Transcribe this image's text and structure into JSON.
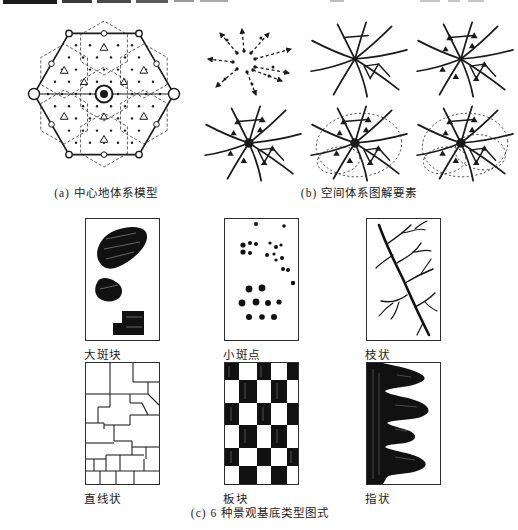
{
  "page": {
    "background": "#ffffff",
    "ink": "#1a1a1a",
    "panel_border": "#2e2e2e"
  },
  "figure_a": {
    "caption": "(a) 中心地体系模型"
  },
  "figure_b": {
    "caption": "(b) 空间体系图解要素"
  },
  "figure_c": {
    "caption": "(c) 6 种景观基底类型图式",
    "panels": [
      {
        "label": "大斑块"
      },
      {
        "label": "小斑点"
      },
      {
        "label": "枝状"
      },
      {
        "label": "直线状"
      },
      {
        "label": "板块"
      },
      {
        "label": "指状"
      }
    ]
  }
}
